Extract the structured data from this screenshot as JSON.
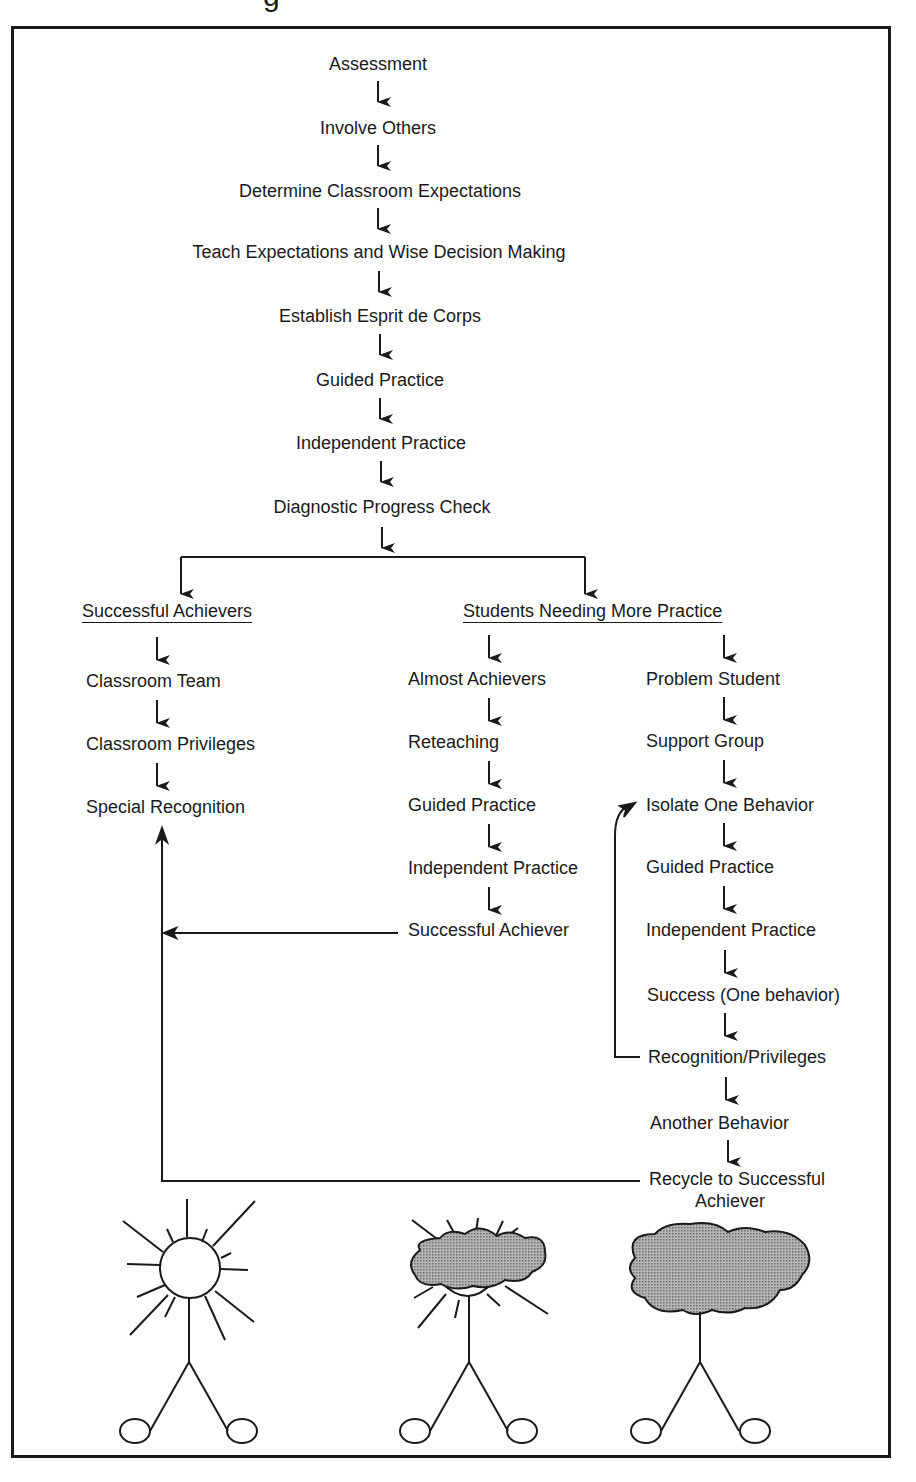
{
  "title_fragment": "g",
  "main_sequence": [
    {
      "label": "Assessment",
      "x": 378,
      "y": 53
    },
    {
      "label": "Involve Others",
      "x": 378,
      "y": 117
    },
    {
      "label": "Determine Classroom Expectations",
      "x": 378,
      "y": 180
    },
    {
      "label": "Teach Expectations and Wise Decision Making",
      "x": 378,
      "y": 242
    },
    {
      "label": "Establish Esprit de Corps",
      "x": 378,
      "y": 305
    },
    {
      "label": "Guided Practice",
      "x": 378,
      "y": 369
    },
    {
      "label": "Independent Practice",
      "x": 380,
      "y": 432
    },
    {
      "label": "Diagnostic Progress Check",
      "x": 382,
      "y": 496
    }
  ],
  "branches": {
    "successful_achievers": {
      "heading": "Successful Achievers",
      "items": [
        "Classroom Team",
        "Classroom Privileges",
        "Special Recognition"
      ]
    },
    "students_needing_more_practice": {
      "heading": "Students Needing More Practice",
      "almost_achievers": {
        "items": [
          "Almost Achievers",
          "Reteaching",
          "Guided Practice",
          "Independent Practice",
          "Successful Achiever"
        ]
      },
      "problem_student": {
        "items": [
          "Problem Student",
          "Support Group",
          "Isolate One Behavior",
          "Guided Practice",
          "Independent Practice",
          "Success (One behavior)",
          "Recognition/Privileges",
          "Another Behavior"
        ],
        "final_line1": "Recycle to Successful",
        "final_line2": "Achiever"
      }
    }
  },
  "illustrations": [
    {
      "name": "sun-figure",
      "meaning": "Successful Achiever"
    },
    {
      "name": "partly-cloudy-figure",
      "meaning": "Almost Achiever"
    },
    {
      "name": "cloud-figure",
      "meaning": "Problem Student"
    }
  ],
  "colors": {
    "ink": "#1a1a1a",
    "cloud_fill": "#9a9a9a",
    "background": "#ffffff"
  }
}
